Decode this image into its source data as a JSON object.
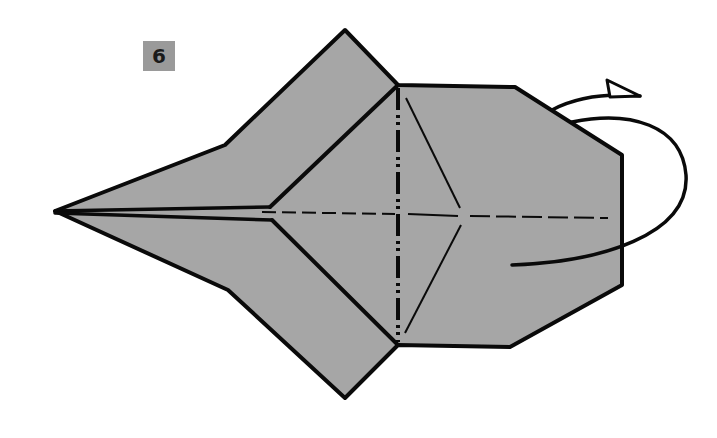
{
  "diagram": {
    "step_number": "6",
    "paper_color": "#a6a6a6",
    "line_color": "#0a0a0a",
    "background": "#ffffff",
    "elements": [
      {
        "type": "step-badge",
        "label": "6"
      },
      {
        "type": "paper-model",
        "description": "Flat origami model with pointed left tip, upper and lower pointed flaps, and hexagonal right body"
      },
      {
        "type": "mountain-fold-line",
        "orientation": "vertical"
      },
      {
        "type": "valley-fold-line",
        "orientation": "horizontal"
      },
      {
        "type": "crease-lines",
        "description": "Diagonal creases forming V shape in right body"
      },
      {
        "type": "turn-over-arrow",
        "description": "Looping arrow with open triangular head indicating to turn the model over"
      }
    ]
  }
}
